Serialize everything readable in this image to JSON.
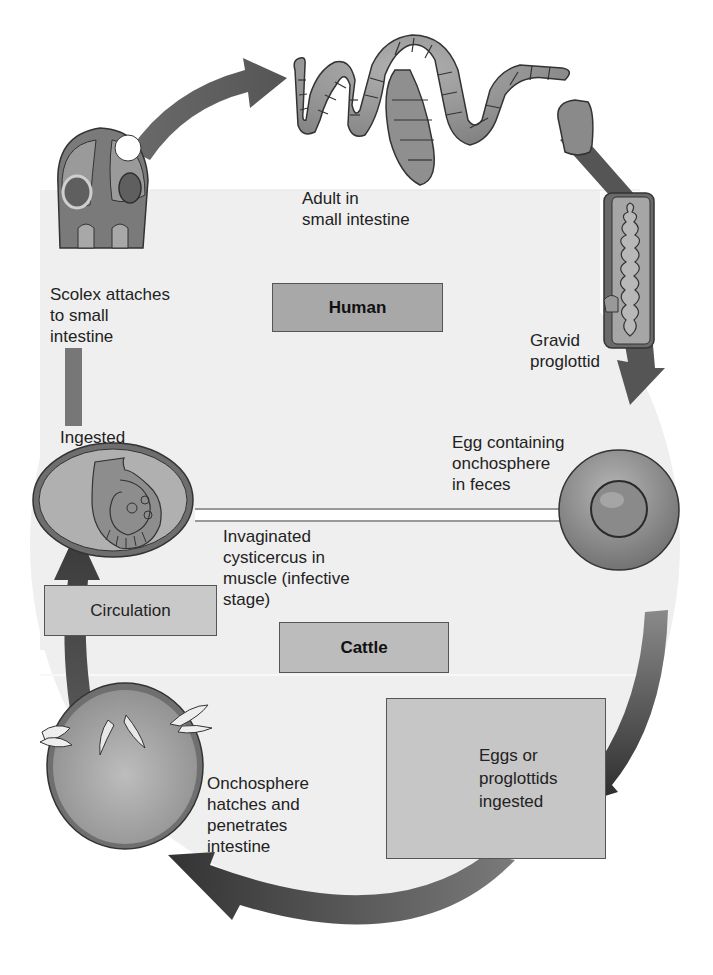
{
  "diagram": {
    "hosts": {
      "human": "Human",
      "cattle": "Cattle"
    },
    "stages": [
      {
        "id": "adult",
        "label": "Adult in\nsmall intestine"
      },
      {
        "id": "gravid",
        "label": "Gravid\nproglottid"
      },
      {
        "id": "egg",
        "label": "Egg containing\nonchosphere\nin feces"
      },
      {
        "id": "eggs-ingested",
        "label": "Eggs or\nproglottids\ningested"
      },
      {
        "id": "onchosphere",
        "label": "Onchosphere\nhatches and\npenetrates\nintestine"
      },
      {
        "id": "circulation",
        "label": "Circulation"
      },
      {
        "id": "cysticercus",
        "label": "Invaginated\ncysticercus in\nmuscle (infective\nstage)"
      },
      {
        "id": "ingested",
        "label": "Ingested"
      },
      {
        "id": "scolex",
        "label": "Scolex attaches\nto small\nintestine"
      }
    ],
    "icons": {
      "scolex": "scolex-icon",
      "adult_worm": "tapeworm-icon",
      "proglottid": "proglottid-icon",
      "egg": "egg-icon",
      "cysticercus": "cysticercus-icon",
      "onchosphere": "onchosphere-icon"
    },
    "colors": {
      "background": "#ffffff",
      "region": "#efefef",
      "arrow": "#4a4a4a",
      "box": "#b9b9b9",
      "host_box": "#a8a8a8"
    }
  }
}
